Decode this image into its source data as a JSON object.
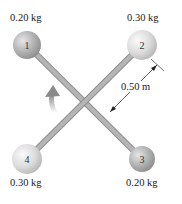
{
  "diagram": {
    "masses": [
      {
        "number": "1",
        "mass": "0.20 kg",
        "position": "upper-left"
      },
      {
        "number": "2",
        "mass": "0.30 kg",
        "position": "upper-right"
      },
      {
        "number": "3",
        "mass": "0.20 kg",
        "position": "lower-right"
      },
      {
        "number": "4",
        "mass": "0.30 kg",
        "position": "lower-left"
      }
    ],
    "dimension": {
      "label": "0.50 m",
      "from": "center",
      "to": "mass-2"
    },
    "rotation_arrow": {
      "direction": "counterclockwise"
    },
    "colors": {
      "rod": "#a9a9a9",
      "ball_dark": "#a8a8a8",
      "ball_light": "#d9d9d9",
      "text": "#222222"
    }
  }
}
